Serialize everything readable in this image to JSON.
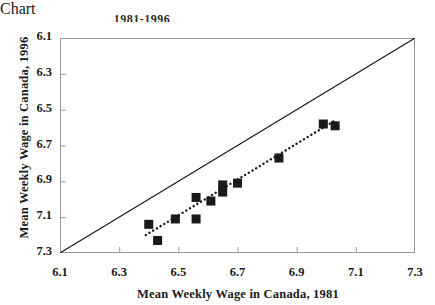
{
  "title_clipped": "1981-1996",
  "axes": {
    "x_title": "Mean Weekly Wage in Canada, 1981",
    "y_title": "Mean Weekly Wage in Canada, 1996",
    "x_ticks": [
      "6.1",
      "6.3",
      "6.5",
      "6.7",
      "6.9",
      "7.1",
      "7.3"
    ],
    "y_ticks": [
      "7.3",
      "7.1",
      "6.9",
      "6.7",
      "6.5",
      "6.3",
      "6.1"
    ]
  },
  "colors": {
    "marker": "#1a1a1a",
    "axis": "#9a9a9a",
    "reference_line": "#1a1a1a",
    "trend_line": "#1a1a1a",
    "background": "#ffffff"
  },
  "chart_data": {
    "type": "scatter",
    "title": "1981-1996",
    "xlabel": "Mean Weekly Wage in Canada, 1981",
    "ylabel": "Mean Weekly Wage in Canada, 1996",
    "xlim": [
      6.1,
      7.3
    ],
    "ylim": [
      6.1,
      7.3
    ],
    "xticks": [
      6.1,
      6.3,
      6.5,
      6.7,
      6.9,
      7.1,
      7.3
    ],
    "yticks": [
      6.1,
      6.3,
      6.5,
      6.7,
      6.9,
      7.1,
      7.3
    ],
    "grid": false,
    "legend": null,
    "points": [
      {
        "x": 6.4,
        "y": 6.26
      },
      {
        "x": 6.43,
        "y": 6.17
      },
      {
        "x": 6.49,
        "y": 6.29
      },
      {
        "x": 6.56,
        "y": 6.41
      },
      {
        "x": 6.56,
        "y": 6.29
      },
      {
        "x": 6.61,
        "y": 6.39
      },
      {
        "x": 6.65,
        "y": 6.48
      },
      {
        "x": 6.65,
        "y": 6.44
      },
      {
        "x": 6.7,
        "y": 6.49
      },
      {
        "x": 6.84,
        "y": 6.63
      },
      {
        "x": 6.99,
        "y": 6.82
      },
      {
        "x": 7.03,
        "y": 6.81
      }
    ],
    "annotations": [
      {
        "name": "reference-line",
        "kind": "line",
        "style": "solid",
        "description": "45-degree identity line y = x",
        "from": [
          6.1,
          6.1
        ],
        "to": [
          7.3,
          7.3
        ]
      },
      {
        "name": "trend-line",
        "kind": "line",
        "style": "dotted",
        "description": "fitted regression trend through the markers",
        "from": [
          6.39,
          6.2
        ],
        "to": [
          7.03,
          6.84
        ]
      }
    ]
  }
}
